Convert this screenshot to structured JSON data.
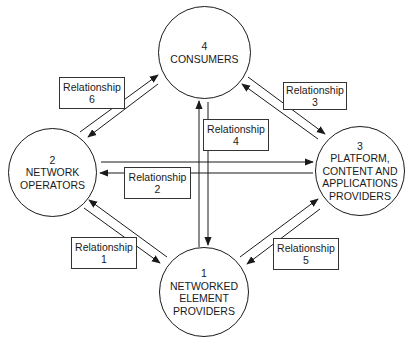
{
  "diagram": {
    "type": "relationship-cycle",
    "nodes": [
      {
        "id": "1",
        "number": "1",
        "lines": [
          "NETWORKED",
          "ELEMENT",
          "PROVIDERS"
        ]
      },
      {
        "id": "2",
        "number": "2",
        "lines": [
          "NETWORK",
          "OPERATORS"
        ]
      },
      {
        "id": "3",
        "number": "3",
        "lines": [
          "PLATFORM,",
          "CONTENT AND",
          "APPLICATIONS",
          "PROVIDERS"
        ]
      },
      {
        "id": "4",
        "number": "4",
        "lines": [
          "CONSUMERS"
        ]
      }
    ],
    "relationships": [
      {
        "label": "Relationship",
        "number": "1",
        "between": [
          "2",
          "1"
        ]
      },
      {
        "label": "Relationship",
        "number": "2",
        "between": [
          "2",
          "3"
        ]
      },
      {
        "label": "Relationship",
        "number": "3",
        "between": [
          "4",
          "3"
        ]
      },
      {
        "label": "Relationship",
        "number": "4",
        "between": [
          "4",
          "1"
        ]
      },
      {
        "label": "Relationship",
        "number": "5",
        "between": [
          "3",
          "1"
        ]
      },
      {
        "label": "Relationship",
        "number": "6",
        "between": [
          "2",
          "4"
        ]
      }
    ],
    "colors": {
      "stroke": "#1a1a1a",
      "background": "#ffffff"
    }
  }
}
